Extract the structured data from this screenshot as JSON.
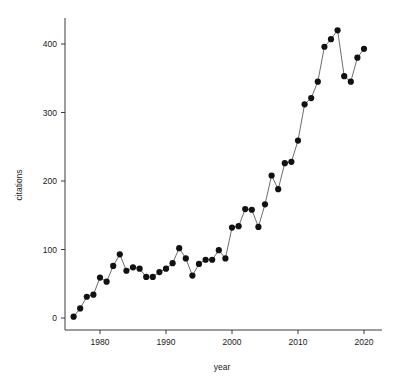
{
  "chart_data": {
    "type": "line",
    "title": "",
    "subtitle": "",
    "xlabel": "year",
    "ylabel": "citations",
    "marker": "filled-circle",
    "grid": false,
    "legend": null,
    "legend_position": "none",
    "xlim": [
      1975,
      2021.5
    ],
    "ylim": [
      -12,
      432
    ],
    "xticks": [
      1980,
      1990,
      2000,
      2010,
      2020
    ],
    "xtick_labels": [
      "1980",
      "1990",
      "2000",
      "2010",
      "2020"
    ],
    "yticks": [
      0,
      100,
      200,
      300,
      400
    ],
    "ytick_labels": [
      "0",
      "100",
      "200",
      "300",
      "400"
    ],
    "x": [
      1976,
      1977,
      1978,
      1979,
      1980,
      1981,
      1982,
      1983,
      1984,
      1985,
      1986,
      1987,
      1988,
      1989,
      1990,
      1991,
      1992,
      1993,
      1994,
      1995,
      1996,
      1997,
      1998,
      1999,
      2000,
      2001,
      2002,
      2003,
      2004,
      2005,
      2006,
      2007,
      2008,
      2009,
      2010,
      2011,
      2012,
      2013,
      2014,
      2015,
      2016,
      2017,
      2018,
      2019,
      2020
    ],
    "values": [
      2,
      14,
      31,
      34,
      59,
      53,
      76,
      93,
      69,
      74,
      72,
      60,
      60,
      67,
      72,
      80,
      102,
      87,
      62,
      79,
      85,
      85,
      99,
      87,
      132,
      134,
      159,
      158,
      133,
      166,
      208,
      188,
      226,
      228,
      259,
      312,
      321,
      345,
      396,
      407,
      420,
      353,
      345,
      380,
      393
    ],
    "series": [
      {
        "name": "citations",
        "color": "#111111",
        "values": [
          2,
          14,
          31,
          34,
          59,
          53,
          76,
          93,
          69,
          74,
          72,
          60,
          60,
          67,
          72,
          80,
          102,
          87,
          62,
          79,
          85,
          85,
          99,
          87,
          132,
          134,
          159,
          158,
          133,
          166,
          208,
          188,
          226,
          228,
          259,
          312,
          321,
          345,
          396,
          407,
          420,
          353,
          345,
          380,
          393
        ]
      }
    ],
    "annotations": []
  },
  "style": {
    "line_color": "#5c5c5c",
    "marker_color": "#111111",
    "axis_color": "#3a3a3a",
    "text_color": "#1a1a1a",
    "background": "#ffffff"
  }
}
